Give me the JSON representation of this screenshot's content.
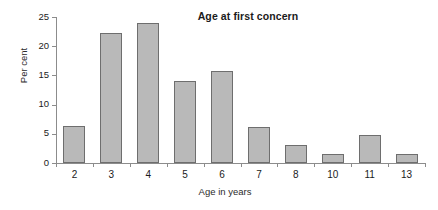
{
  "chart_data": {
    "type": "bar",
    "title": "Age at first concern",
    "xlabel": "Age in years",
    "ylabel": "Per cent",
    "categories": [
      "2",
      "3",
      "4",
      "5",
      "6",
      "7",
      "8",
      "10",
      "11",
      "13"
    ],
    "values": [
      6.3,
      22.2,
      24.0,
      14.1,
      15.7,
      6.2,
      3.0,
      1.5,
      4.8,
      1.5
    ],
    "series": [
      {
        "name": "Per cent",
        "values": [
          6.3,
          22.2,
          24.0,
          14.1,
          15.7,
          6.2,
          3.0,
          1.5,
          4.8,
          1.5
        ]
      }
    ],
    "ylim": [
      0,
      25
    ],
    "yticks": [
      0,
      5,
      10,
      15,
      20,
      25
    ],
    "ytick_labels": [
      "0",
      "5",
      "10",
      "15",
      "20",
      "25"
    ],
    "xlim_categories": 10,
    "grid": false,
    "legend": false,
    "legend_position": "none",
    "bar_fill_color": "#b9b9b9",
    "bar_edge_color": "#6e6e6e",
    "axis_color": "#8c8c8c",
    "text_color": "#1b1b1b",
    "background_color": "#ffffff"
  }
}
